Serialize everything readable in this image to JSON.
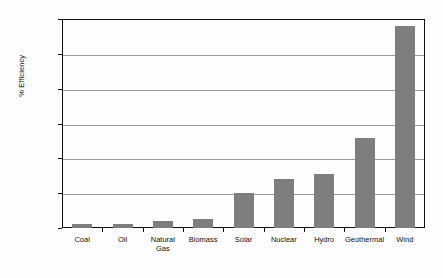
{
  "chart_data": {
    "type": "bar",
    "title": "",
    "xlabel": "",
    "ylabel": "% Efficiency",
    "ylim": [
      0,
      1200
    ],
    "ytick_labels": [
      "1,200",
      "1,000",
      "800",
      "600",
      "400",
      "200",
      "0"
    ],
    "yticks": [
      1200,
      1000,
      800,
      600,
      400,
      200,
      0
    ],
    "grid": true,
    "legend": "none",
    "bar_color": "#7e7e7e",
    "categories": [
      "Coal",
      "Oil",
      "Natural\nGas",
      "Biomass",
      "Solar",
      "Nuclear",
      "Hydro",
      "Geothermal",
      "Wind"
    ],
    "values": [
      25,
      22,
      42,
      50,
      200,
      280,
      310,
      515,
      1160
    ]
  },
  "axis": {
    "y_title": "% Efficiency"
  }
}
